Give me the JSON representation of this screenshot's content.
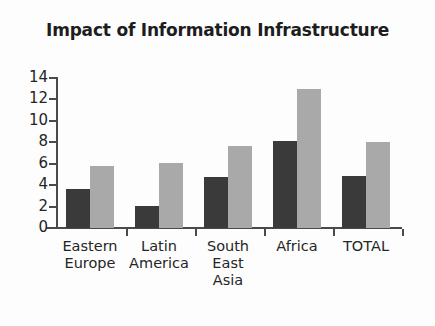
{
  "chart_data": {
    "type": "bar",
    "title": "Impact of Information Infrastructure",
    "xlabel": "",
    "ylabel": "",
    "ylim": [
      0,
      14
    ],
    "yticks": [
      0,
      2,
      4,
      6,
      8,
      10,
      12,
      14
    ],
    "ytick_labels": [
      "0",
      "2",
      "4",
      "6",
      "8",
      "10",
      "12",
      "14"
    ],
    "grid": false,
    "legend": "none",
    "categories": [
      "Eastern Europe",
      "Latin America",
      "South East Asia",
      "Africa",
      "TOTAL"
    ],
    "category_lines": [
      [
        "Eastern",
        "Europe"
      ],
      [
        "Latin",
        "America"
      ],
      [
        "South",
        "East",
        "Asia"
      ],
      [
        "Africa"
      ],
      [
        "TOTAL"
      ]
    ],
    "series": [
      {
        "name": "series-1",
        "color": "#3a3a3a",
        "values": [
          3.6,
          2.1,
          4.8,
          8.1,
          4.9
        ]
      },
      {
        "name": "series-2",
        "color": "#a9a9a9",
        "values": [
          5.8,
          6.1,
          7.7,
          13.0,
          8.0
        ]
      }
    ]
  },
  "colors": {
    "series_dark": "#3a3a3a",
    "series_light": "#a9a9a9",
    "axis": "#4a4a4a",
    "text": "#252525",
    "background": "#fdfdfd"
  }
}
